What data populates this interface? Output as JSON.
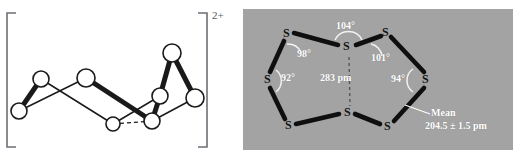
{
  "figure": {
    "kind": "chemical-structure-pair",
    "panels": [
      "left-ball-and-stick",
      "right-labeled-photo"
    ]
  },
  "left_panel": {
    "name": "bracketed-cluster-structure",
    "charge_label": "2+",
    "bracket": {
      "open": "[",
      "close": "]"
    },
    "atom_count": 8,
    "atoms": [
      {
        "id": "a1",
        "cx": 19,
        "cy": 111,
        "r": 8
      },
      {
        "id": "a2",
        "cx": 41,
        "cy": 79,
        "r": 8
      },
      {
        "id": "a3",
        "cx": 86,
        "cy": 78,
        "r": 9
      },
      {
        "id": "a4",
        "cx": 113,
        "cy": 124,
        "r": 7
      },
      {
        "id": "a5",
        "cx": 152,
        "cy": 121,
        "r": 8
      },
      {
        "id": "a6",
        "cx": 160,
        "cy": 96,
        "r": 8
      },
      {
        "id": "a7",
        "cx": 172,
        "cy": 53,
        "r": 9
      },
      {
        "id": "a8",
        "cx": 195,
        "cy": 98,
        "r": 9
      }
    ],
    "bonds": [
      {
        "from": "a1",
        "to": "a2",
        "style": "wedge"
      },
      {
        "from": "a1",
        "to": "a3",
        "style": "line"
      },
      {
        "from": "a2",
        "to": "a4",
        "style": "line"
      },
      {
        "from": "a3",
        "to": "a5",
        "style": "wedge"
      },
      {
        "from": "a4",
        "to": "a6",
        "style": "line"
      },
      {
        "from": "a5",
        "to": "a6",
        "style": "wedge"
      },
      {
        "from": "a6",
        "to": "a7",
        "style": "wedge"
      },
      {
        "from": "a7",
        "to": "a8",
        "style": "wedge"
      },
      {
        "from": "a5",
        "to": "a8",
        "style": "line"
      },
      {
        "from": "a4",
        "to": "a5",
        "style": "dashed"
      }
    ]
  },
  "right_panel": {
    "name": "s8-dication-labeled-diagram",
    "background_color": "#a3a3a3",
    "label_color": "#ffffff",
    "atom_label": "S",
    "atoms": [
      {
        "id": "s1",
        "label": "S",
        "x": 46,
        "y": 34
      },
      {
        "id": "s2",
        "label": "S",
        "x": 106,
        "y": 47
      },
      {
        "id": "s3",
        "label": "S",
        "x": 145,
        "y": 33
      },
      {
        "id": "s4",
        "label": "S",
        "x": 185,
        "y": 80
      },
      {
        "id": "s5",
        "label": "S",
        "x": 147,
        "y": 127
      },
      {
        "id": "s6",
        "label": "S",
        "x": 107,
        "y": 113
      },
      {
        "id": "s7",
        "label": "S",
        "x": 48,
        "y": 126
      },
      {
        "id": "s8",
        "label": "S",
        "x": 27,
        "y": 80
      }
    ],
    "bonds": [
      {
        "from": "s1",
        "to": "s2",
        "style": "thick"
      },
      {
        "from": "s2",
        "to": "s3",
        "style": "thick"
      },
      {
        "from": "s3",
        "to": "s4",
        "style": "thick"
      },
      {
        "from": "s4",
        "to": "s5",
        "style": "thick"
      },
      {
        "from": "s5",
        "to": "s6",
        "style": "thick"
      },
      {
        "from": "s6",
        "to": "s7",
        "style": "thick"
      },
      {
        "from": "s7",
        "to": "s8",
        "style": "thick"
      },
      {
        "from": "s8",
        "to": "s1",
        "style": "thick"
      },
      {
        "from": "s2",
        "to": "s6",
        "style": "dashed-transannular"
      }
    ],
    "angles": [
      {
        "id": "ang-104",
        "value": "104°",
        "x": 96,
        "y": 26
      },
      {
        "id": "ang-98",
        "value": "98°",
        "x": 58,
        "y": 54
      },
      {
        "id": "ang-101",
        "value": "101°",
        "x": 131,
        "y": 58
      },
      {
        "id": "ang-92",
        "value": "92°",
        "x": 42,
        "y": 76
      },
      {
        "id": "ang-94",
        "value": "94°",
        "x": 153,
        "y": 78
      }
    ],
    "distance": {
      "id": "transannular-distance",
      "value": "283 pm",
      "x": 83,
      "y": 75
    },
    "mean": {
      "id": "mean-bond-length",
      "line1": "Mean",
      "line2": "204.5 ± 1.5 pm",
      "x": 192,
      "y": 111
    }
  }
}
